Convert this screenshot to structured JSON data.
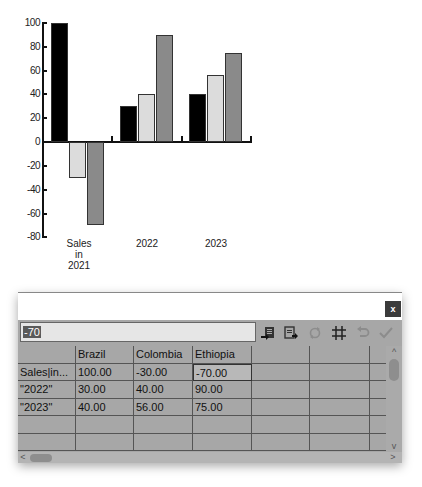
{
  "chart_data": {
    "type": "bar",
    "title": "",
    "xlabel": "",
    "ylabel": "",
    "categories": [
      "Sales in 2021",
      "2022",
      "2023"
    ],
    "series": [
      {
        "name": "Brazil",
        "color": "#000000",
        "values": [
          100,
          30,
          40
        ]
      },
      {
        "name": "Colombia",
        "color": "#dcdcdc",
        "values": [
          -30,
          40,
          56
        ]
      },
      {
        "name": "Ethiopia",
        "color": "#8a8a8a",
        "values": [
          -70,
          90,
          75
        ]
      }
    ],
    "ylim": [
      -80,
      100
    ],
    "yticks": [
      "100",
      "80",
      "60",
      "40",
      "20",
      "0",
      "-20",
      "-40",
      "-60",
      "-80"
    ],
    "xtick_labels": {
      "c0_l1": "Sales",
      "c0_l2": "in",
      "c0_l3": "2021",
      "c1": "2022",
      "c2": "2023"
    },
    "grid": false,
    "legend": "none"
  },
  "dialog": {
    "close_label": "x",
    "cell_input_value": "-70",
    "toolbar_icons": [
      "import-data-icon",
      "export-data-icon",
      "swap-axes-icon",
      "grid-icon",
      "undo-icon",
      "apply-check-icon"
    ]
  },
  "table": {
    "headers": [
      "",
      "Brazil",
      "Colombia",
      "Ethiopia",
      "",
      "",
      ""
    ],
    "rows": [
      [
        "Sales|in...",
        "100.00",
        "-30.00",
        "-70.00",
        "",
        "",
        ""
      ],
      [
        "\"2022\"",
        "30.00",
        "40.00",
        "90.00",
        "",
        "",
        ""
      ],
      [
        "\"2023\"",
        "40.00",
        "56.00",
        "75.00",
        "",
        "",
        ""
      ],
      [
        "",
        "",
        "",
        "",
        "",
        "",
        ""
      ],
      [
        "",
        "",
        "",
        "",
        "",
        "",
        ""
      ]
    ],
    "active_cell": {
      "row": 0,
      "col": 3
    }
  },
  "scrollbars": {
    "up": "^",
    "down": "v",
    "left": "<",
    "right": ">"
  }
}
